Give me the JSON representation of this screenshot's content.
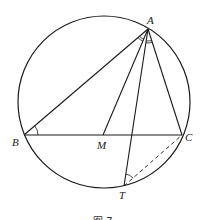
{
  "figure": {
    "caption": "图 7",
    "colors": {
      "stroke": "#1a1a1a",
      "background": "#ffffff"
    },
    "circle": {
      "cx": 104,
      "cy": 102,
      "r": 86
    },
    "points": {
      "A": {
        "label": "A",
        "x": 148,
        "y": 29
      },
      "B": {
        "label": "B",
        "x": 24,
        "y": 135
      },
      "C": {
        "label": "C",
        "x": 182,
        "y": 135
      },
      "M": {
        "label": "M",
        "x": 103,
        "y": 135
      },
      "T": {
        "label": "T",
        "x": 124,
        "y": 186
      }
    },
    "segments": [
      {
        "from": "A",
        "to": "B",
        "style": "solid"
      },
      {
        "from": "A",
        "to": "M",
        "style": "solid"
      },
      {
        "from": "A",
        "to": "T",
        "style": "solid"
      },
      {
        "from": "A",
        "to": "C",
        "style": "solid"
      },
      {
        "from": "B",
        "to": "C",
        "style": "solid"
      },
      {
        "from": "T",
        "to": "C",
        "style": "dashed"
      }
    ],
    "angle_marks": [
      {
        "vertex": "A",
        "between": [
          "B",
          "M"
        ],
        "type": "double-arc"
      },
      {
        "vertex": "A",
        "between": [
          "T",
          "C"
        ],
        "type": "double-arc"
      },
      {
        "vertex": "B",
        "between": [
          "A",
          "C"
        ],
        "type": "arc"
      },
      {
        "vertex": "T",
        "between": [
          "A",
          "C"
        ],
        "type": "arc"
      }
    ]
  }
}
